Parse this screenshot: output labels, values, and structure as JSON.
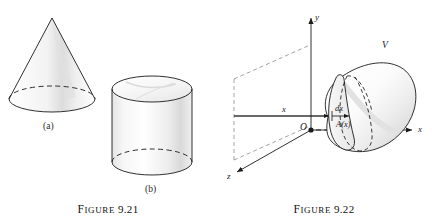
{
  "page": {
    "background_color": "#ffffff",
    "ink_color": "#1a1a1a",
    "shade_color": "#e8e8e8"
  },
  "figures": [
    {
      "id": "figure-9-21",
      "caption_lead": "F",
      "caption_rest": "IGURE",
      "caption_number": "9.21",
      "caption_full": "FIGURE 9.21",
      "subfigures": [
        {
          "key": "a",
          "label": "(a)",
          "shape": "cone"
        },
        {
          "key": "b",
          "label": "(b)",
          "shape": "cylinder"
        }
      ]
    },
    {
      "id": "figure-9-22",
      "caption_lead": "F",
      "caption_rest": "IGURE",
      "caption_number": "9.22",
      "caption_full": "FIGURE 9.22",
      "axes": {
        "y_label": "y",
        "x_label": "x",
        "z_label": "z",
        "origin_label": "O"
      },
      "annotations": {
        "distance_label": "x",
        "thickness_label": "dx",
        "area_label": "A(x)",
        "volume_label": "V"
      }
    }
  ]
}
